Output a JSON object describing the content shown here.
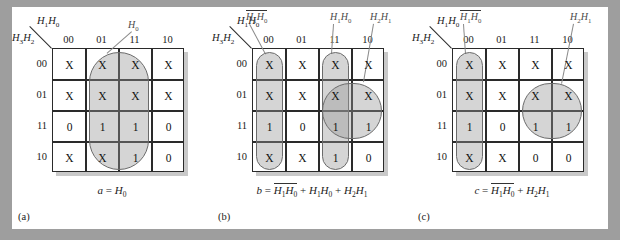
{
  "figure": {
    "background_color": "#9e9e9e",
    "sheet_color": "#ffffff",
    "group_fill": "#bdbdbd",
    "group_stroke": "#6b6b6b",
    "grid_stroke": "#2a2a2a"
  },
  "axes": {
    "col_var": "H1H0",
    "row_var": "H3H2",
    "col_labels": [
      "00",
      "01",
      "11",
      "10"
    ],
    "row_labels": [
      "00",
      "01",
      "11",
      "10"
    ]
  },
  "maps": [
    {
      "id": "a",
      "sub_label": "(a)",
      "equation": "a = H0",
      "equation_parts": [
        {
          "text": "a",
          "italic": true
        },
        {
          "text": " = ",
          "italic": false
        },
        {
          "text": "H",
          "italic": true,
          "sub": "0"
        }
      ],
      "annotations": [
        {
          "name": "H0",
          "parts": [
            {
              "text": "H",
              "italic": true,
              "sub": "0",
              "bar": false
            }
          ]
        }
      ],
      "cells": [
        [
          "X",
          "X",
          "X",
          "X"
        ],
        [
          "X",
          "X",
          "X",
          "X"
        ],
        [
          "0",
          "1",
          "1",
          "0"
        ],
        [
          "X",
          "X",
          "1",
          "0"
        ]
      ],
      "groups": [
        {
          "label": "H0",
          "col_start": 1,
          "col_span": 2,
          "row_start": 0,
          "row_span": 4
        }
      ]
    },
    {
      "id": "b",
      "sub_label": "(b)",
      "equation": "b = H1'H0' + H1H0 + H2H1",
      "equation_parts": [
        {
          "text": "b",
          "italic": true
        },
        {
          "text": " = ",
          "italic": false
        },
        {
          "text": "H",
          "italic": true,
          "sub": "1",
          "bar": true
        },
        {
          "text": "H",
          "italic": true,
          "sub": "0",
          "bar": true
        },
        {
          "text": " + ",
          "italic": false
        },
        {
          "text": "H",
          "italic": true,
          "sub": "1"
        },
        {
          "text": "H",
          "italic": true,
          "sub": "0"
        },
        {
          "text": " + ",
          "italic": false
        },
        {
          "text": "H",
          "italic": true,
          "sub": "2"
        },
        {
          "text": "H",
          "italic": true,
          "sub": "1"
        }
      ],
      "annotations": [
        {
          "name": "H1'H0'"
        },
        {
          "name": "H1H0"
        },
        {
          "name": "H2H1"
        }
      ],
      "cells": [
        [
          "X",
          "X",
          "X",
          "X"
        ],
        [
          "X",
          "X",
          "X",
          "X"
        ],
        [
          "1",
          "0",
          "1",
          "1"
        ],
        [
          "X",
          "X",
          "1",
          "0"
        ]
      ],
      "groups": [
        {
          "label": "H1'H0'",
          "col_start": 0,
          "col_span": 1,
          "row_start": 0,
          "row_span": 4
        },
        {
          "label": "H1H0",
          "col_start": 2,
          "col_span": 1,
          "row_start": 0,
          "row_span": 4
        },
        {
          "label": "H2H1",
          "col_start": 2,
          "col_span": 2,
          "row_start": 1,
          "row_span": 2
        }
      ]
    },
    {
      "id": "c",
      "sub_label": "(c)",
      "equation": "c = H1'H0' + H2H1",
      "equation_parts": [
        {
          "text": "c",
          "italic": true
        },
        {
          "text": " = ",
          "italic": false
        },
        {
          "text": "H",
          "italic": true,
          "sub": "1",
          "bar": true
        },
        {
          "text": "H",
          "italic": true,
          "sub": "0",
          "bar": true
        },
        {
          "text": " + ",
          "italic": false
        },
        {
          "text": "H",
          "italic": true,
          "sub": "2"
        },
        {
          "text": "H",
          "italic": true,
          "sub": "1"
        }
      ],
      "annotations": [
        {
          "name": "H1'H0'"
        },
        {
          "name": "H2H1"
        }
      ],
      "cells": [
        [
          "X",
          "X",
          "X",
          "X"
        ],
        [
          "X",
          "X",
          "X",
          "X"
        ],
        [
          "1",
          "0",
          "1",
          "1"
        ],
        [
          "X",
          "X",
          "0",
          "0"
        ]
      ],
      "groups": [
        {
          "label": "H1'H0'",
          "col_start": 0,
          "col_span": 1,
          "row_start": 0,
          "row_span": 4
        },
        {
          "label": "H2H1",
          "col_start": 2,
          "col_span": 2,
          "row_start": 1,
          "row_span": 2
        }
      ]
    }
  ]
}
